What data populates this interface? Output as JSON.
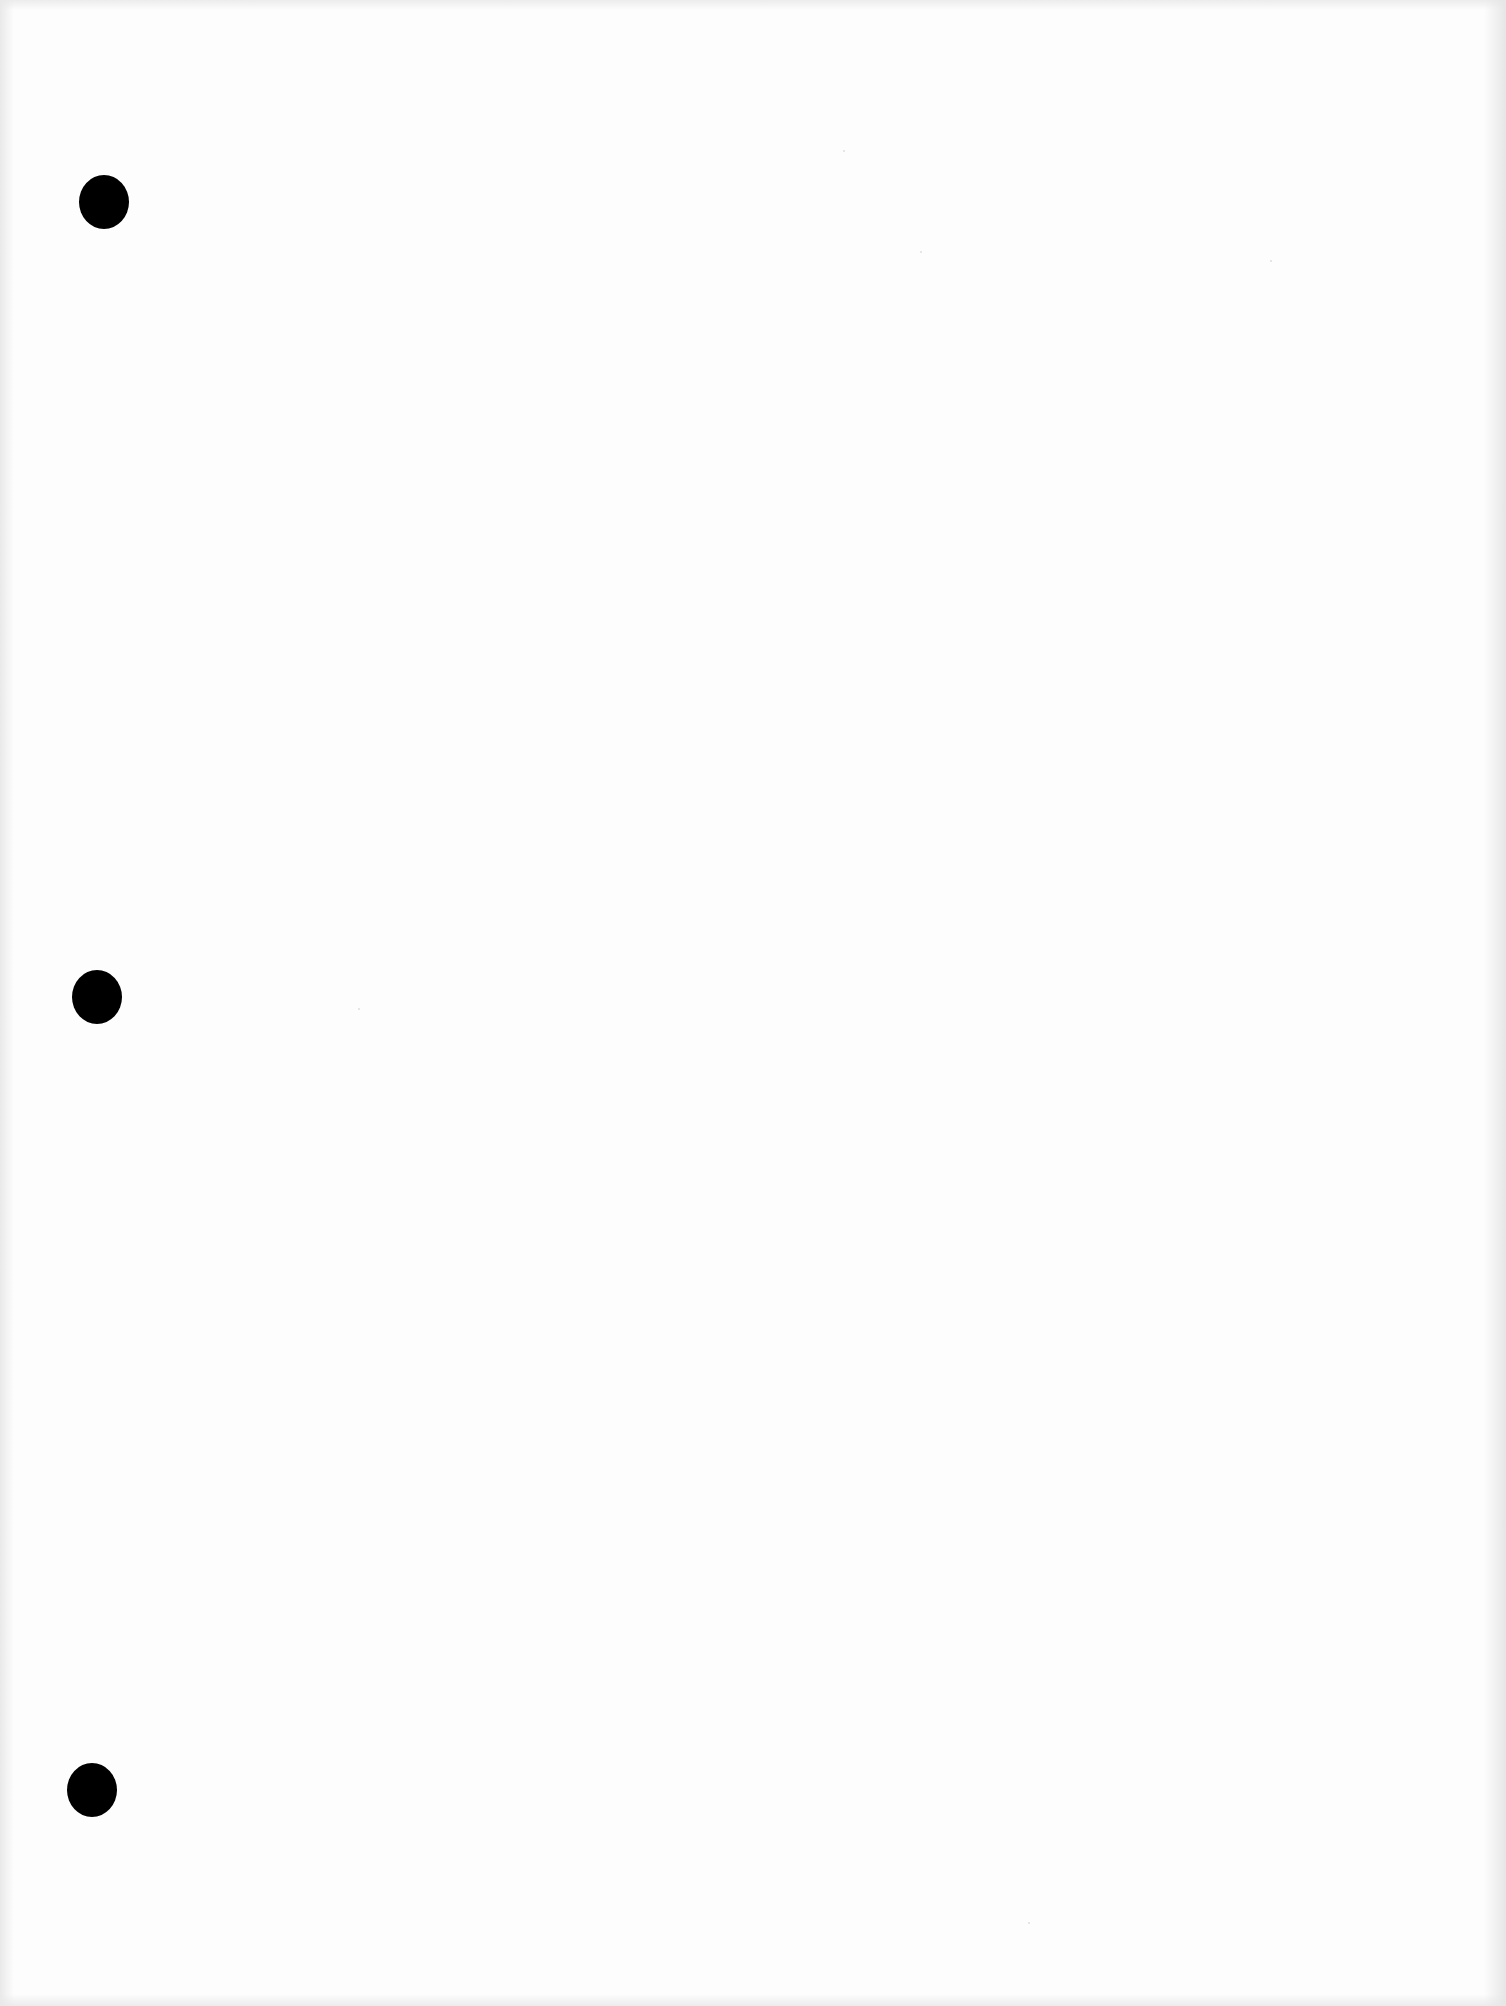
{
  "document": {
    "type": "blank scanned page",
    "text": "",
    "background_color": "#fdfdfd",
    "punch_holes": [
      {
        "label": "punch-hole-top",
        "x": 79,
        "y": 175,
        "color": "#000000"
      },
      {
        "label": "punch-hole-middle",
        "x": 72,
        "y": 970,
        "color": "#000000"
      },
      {
        "label": "punch-hole-bottom",
        "x": 67,
        "y": 1763,
        "color": "#000000"
      }
    ]
  }
}
